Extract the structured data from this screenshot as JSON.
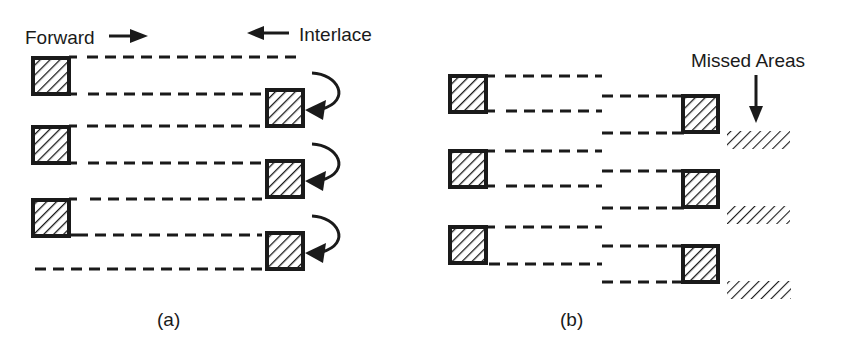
{
  "diagram": {
    "panel_a": {
      "caption": "(a)",
      "forward_label": "Forward",
      "interlace_label": "Interlace",
      "left_boxes": [
        {
          "x": 32,
          "y": 57,
          "w": 37,
          "h": 37
        },
        {
          "x": 32,
          "y": 126,
          "w": 37,
          "h": 37
        },
        {
          "x": 32,
          "y": 199,
          "w": 37,
          "h": 37
        }
      ],
      "right_boxes": [
        {
          "x": 266,
          "y": 89,
          "w": 37,
          "h": 37
        },
        {
          "x": 266,
          "y": 161,
          "w": 37,
          "h": 37
        },
        {
          "x": 266,
          "y": 232,
          "w": 37,
          "h": 37
        }
      ],
      "scan_lines_y": [
        57,
        94,
        126,
        163,
        199,
        236,
        269
      ],
      "curved_arrows": 3
    },
    "panel_b": {
      "caption": "(b)",
      "missed_label": "Missed Areas",
      "left_boxes": [
        {
          "x": 449,
          "y": 75,
          "w": 37,
          "h": 37
        },
        {
          "x": 449,
          "y": 151,
          "w": 37,
          "h": 37
        },
        {
          "x": 449,
          "y": 226,
          "w": 37,
          "h": 37
        }
      ],
      "right_boxes": [
        {
          "x": 682,
          "y": 95,
          "w": 36,
          "h": 37
        },
        {
          "x": 682,
          "y": 170,
          "w": 36,
          "h": 37
        },
        {
          "x": 682,
          "y": 245,
          "w": 36,
          "h": 37
        }
      ],
      "missed_areas": [
        {
          "x": 727,
          "y": 131,
          "w": 63,
          "h": 18
        },
        {
          "x": 727,
          "y": 206,
          "w": 63,
          "h": 18
        },
        {
          "x": 727,
          "y": 280,
          "w": 64,
          "h": 19
        }
      ]
    }
  }
}
